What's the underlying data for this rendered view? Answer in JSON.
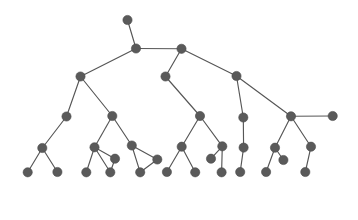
{
  "figure": {
    "type": "node-link-tree",
    "background_color": "#ffffff",
    "node_color": "#5a5a5a",
    "edge_color": "#565656",
    "node_radius": 4.6,
    "edge_width": 1.15,
    "width": 358,
    "height": 220,
    "node_count": 45,
    "edge_count": 44
  },
  "graph": {
    "nodes": [
      {
        "id": "n0",
        "x": 127.5,
        "y": 20.0,
        "label": ""
      },
      {
        "id": "n1",
        "x": 136.0,
        "y": 48.5,
        "label": ""
      },
      {
        "id": "n2",
        "x": 181.5,
        "y": 48.8,
        "label": ""
      },
      {
        "id": "n3",
        "x": 80.5,
        "y": 76.5,
        "label": ""
      },
      {
        "id": "n4",
        "x": 165.5,
        "y": 76.5,
        "label": ""
      },
      {
        "id": "n5",
        "x": 236.5,
        "y": 76.0,
        "label": ""
      },
      {
        "id": "n6",
        "x": 66.5,
        "y": 116.5,
        "label": ""
      },
      {
        "id": "n7",
        "x": 112.3,
        "y": 116.0,
        "label": ""
      },
      {
        "id": "n8",
        "x": 200.0,
        "y": 116.0,
        "label": ""
      },
      {
        "id": "n9",
        "x": 243.3,
        "y": 117.5,
        "label": ""
      },
      {
        "id": "n10",
        "x": 291.0,
        "y": 116.3,
        "label": ""
      },
      {
        "id": "n11",
        "x": 332.7,
        "y": 116.0,
        "label": ""
      },
      {
        "id": "n12",
        "x": 42.3,
        "y": 148.0,
        "label": ""
      },
      {
        "id": "n13",
        "x": 94.5,
        "y": 147.3,
        "label": ""
      },
      {
        "id": "n14",
        "x": 115.0,
        "y": 158.7,
        "label": ""
      },
      {
        "id": "n15",
        "x": 131.8,
        "y": 145.5,
        "label": ""
      },
      {
        "id": "n16",
        "x": 157.3,
        "y": 159.5,
        "label": ""
      },
      {
        "id": "n17",
        "x": 181.7,
        "y": 146.7,
        "label": ""
      },
      {
        "id": "n18",
        "x": 211.0,
        "y": 158.7,
        "label": ""
      },
      {
        "id": "n19",
        "x": 222.3,
        "y": 146.3,
        "label": ""
      },
      {
        "id": "n20",
        "x": 243.6,
        "y": 147.6,
        "label": ""
      },
      {
        "id": "n21",
        "x": 275.0,
        "y": 147.7,
        "label": ""
      },
      {
        "id": "n22",
        "x": 283.4,
        "y": 160.0,
        "label": ""
      },
      {
        "id": "n23",
        "x": 311.0,
        "y": 146.7,
        "label": ""
      },
      {
        "id": "n24",
        "x": 27.7,
        "y": 172.3,
        "label": ""
      },
      {
        "id": "n25",
        "x": 57.4,
        "y": 172.0,
        "label": ""
      },
      {
        "id": "n26",
        "x": 86.3,
        "y": 172.3,
        "label": ""
      },
      {
        "id": "n27",
        "x": 110.3,
        "y": 172.3,
        "label": ""
      },
      {
        "id": "n28",
        "x": 140.2,
        "y": 172.3,
        "label": ""
      },
      {
        "id": "n29",
        "x": 166.9,
        "y": 172.0,
        "label": ""
      },
      {
        "id": "n30",
        "x": 195.2,
        "y": 172.3,
        "label": ""
      },
      {
        "id": "n31",
        "x": 221.6,
        "y": 172.3,
        "label": ""
      },
      {
        "id": "n32",
        "x": 240.2,
        "y": 172.0,
        "label": ""
      },
      {
        "id": "n33",
        "x": 266.1,
        "y": 172.0,
        "label": ""
      },
      {
        "id": "n34",
        "x": 305.3,
        "y": 172.0,
        "label": ""
      }
    ],
    "edges": [
      {
        "source": "n0",
        "target": "n1"
      },
      {
        "source": "n1",
        "target": "n2"
      },
      {
        "source": "n1",
        "target": "n3"
      },
      {
        "source": "n2",
        "target": "n4"
      },
      {
        "source": "n2",
        "target": "n5"
      },
      {
        "source": "n3",
        "target": "n6"
      },
      {
        "source": "n3",
        "target": "n7"
      },
      {
        "source": "n4",
        "target": "n8"
      },
      {
        "source": "n5",
        "target": "n9"
      },
      {
        "source": "n5",
        "target": "n10"
      },
      {
        "source": "n10",
        "target": "n11"
      },
      {
        "source": "n6",
        "target": "n12"
      },
      {
        "source": "n7",
        "target": "n13"
      },
      {
        "source": "n7",
        "target": "n15"
      },
      {
        "source": "n13",
        "target": "n14"
      },
      {
        "source": "n13",
        "target": "n26"
      },
      {
        "source": "n13",
        "target": "n27"
      },
      {
        "source": "n14",
        "target": "n27"
      },
      {
        "source": "n15",
        "target": "n16"
      },
      {
        "source": "n15",
        "target": "n28"
      },
      {
        "source": "n8",
        "target": "n17"
      },
      {
        "source": "n8",
        "target": "n19"
      },
      {
        "source": "n17",
        "target": "n29"
      },
      {
        "source": "n17",
        "target": "n30"
      },
      {
        "source": "n19",
        "target": "n18"
      },
      {
        "source": "n19",
        "target": "n31"
      },
      {
        "source": "n9",
        "target": "n20"
      },
      {
        "source": "n20",
        "target": "n32"
      },
      {
        "source": "n10",
        "target": "n21"
      },
      {
        "source": "n10",
        "target": "n23"
      },
      {
        "source": "n21",
        "target": "n22"
      },
      {
        "source": "n21",
        "target": "n33"
      },
      {
        "source": "n23",
        "target": "n34"
      },
      {
        "source": "n12",
        "target": "n24"
      },
      {
        "source": "n12",
        "target": "n25"
      },
      {
        "source": "n16",
        "target": "n28"
      }
    ]
  }
}
